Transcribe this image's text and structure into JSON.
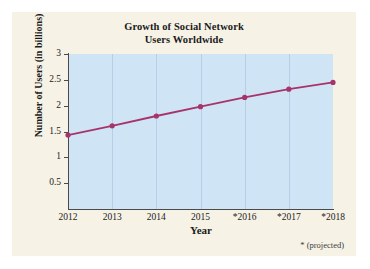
{
  "figure": {
    "title_line1": "Growth of Social Network",
    "title_line2": "Users Worldwide",
    "footnote": "* (projected)",
    "panel_background": "#f6f2e6",
    "plot_background": "#cfe4f5",
    "series_color": "#a8336a",
    "axis_color": "#4a4a4a",
    "grid_color": "#b6cfe6"
  },
  "chart_data": {
    "type": "line",
    "title": "Growth of Social Network Users Worldwide",
    "xlabel": "Year",
    "ylabel": "Number of Users (in billions)",
    "categories": [
      "2012",
      "2013",
      "2014",
      "2015",
      "*2016",
      "*2017",
      "*2018"
    ],
    "x": [
      2012,
      2013,
      2014,
      2015,
      2016,
      2017,
      2018
    ],
    "values": [
      1.43,
      1.61,
      1.8,
      1.98,
      2.16,
      2.32,
      2.45
    ],
    "series": [
      {
        "name": "Number of Users (in billions)",
        "values": [
          1.43,
          1.61,
          1.8,
          1.98,
          2.16,
          2.32,
          2.45
        ]
      }
    ],
    "ylim": [
      0,
      3
    ],
    "yticks": [
      0.5,
      1,
      1.5,
      2,
      2.5,
      3
    ],
    "ytick_labels": [
      "0.5",
      "1",
      "1.5",
      "2",
      "2.5",
      "3"
    ],
    "xtick_labels": [
      "2012",
      "2013",
      "2014",
      "2015",
      "*2016",
      "*2017",
      "*2018"
    ],
    "grid": "vertical",
    "legend": "none",
    "markers": "filled-circle",
    "annotation": "* (projected)"
  }
}
